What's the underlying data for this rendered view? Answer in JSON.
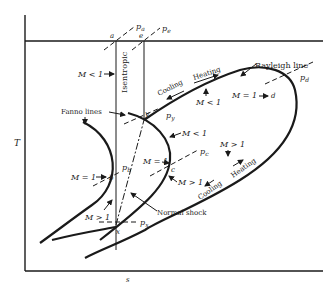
{
  "axes": {
    "y_label": "T",
    "x_label": "s"
  },
  "points": {
    "a": "a",
    "e": "e",
    "y": "y",
    "b": "b",
    "c": "c",
    "d": "d",
    "x": "x"
  },
  "pressures": {
    "pa": "p",
    "pa_sub": "a",
    "pe": "p",
    "pe_sub": "e",
    "py": "p",
    "py_sub": "y",
    "pb": "p",
    "pb_sub": "b",
    "pc": "p",
    "pc_sub": "c",
    "pd": "p",
    "pd_sub": "d",
    "px": "p",
    "px_sub": "x"
  },
  "labels": {
    "isentropic": "Isentropic",
    "fanno_lines": "Fanno lines",
    "rayleigh_line": "Rayleigh line",
    "normal_shock": "Normal shock",
    "cooling_upper": "Cooling",
    "heating_upper": "Heating",
    "cooling_lower": "Cooling",
    "heating_lower": "Heating",
    "m_lt_1_left": "M < 1",
    "m_lt_1_rayleigh": "M < 1",
    "m_lt_1_fanno": "M < 1",
    "m_eq_1_b": "M = 1",
    "m_eq_1_c": "M = 1",
    "m_eq_1_d": "M = 1",
    "m_gt_1_c": "M > 1",
    "m_gt_1_rayleigh": "M > 1",
    "m_gt_1_x": "M > 1"
  }
}
